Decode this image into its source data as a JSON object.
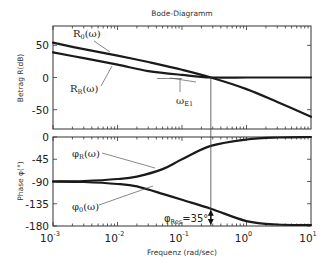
{
  "chart_data": [
    {
      "type": "line",
      "panel": "magnitude",
      "title": "Bode-Diagramm",
      "xlabel": "",
      "ylabel": "Betrag R(dB)",
      "xscale": "log",
      "xlim": [
        0.001,
        10
      ],
      "ylim": [
        -80,
        80
      ],
      "yticks": [
        50,
        0,
        -50
      ],
      "ytick_labels": [
        "50",
        "0",
        "-50"
      ],
      "grid": false,
      "series": [
        {
          "name": "R0(ω)",
          "label_text": "R",
          "label_sub": "0",
          "label_suffix": "(ω)",
          "x": [
            0.001,
            0.003,
            0.01,
            0.03,
            0.1,
            0.28,
            1,
            3,
            10
          ],
          "y": [
            54,
            44,
            34,
            24,
            12,
            0,
            -18,
            -38,
            -61
          ]
        },
        {
          "name": "RR(ω)",
          "label_text": "R",
          "label_sub": "R",
          "label_suffix": "(ω)",
          "x": [
            0.001,
            0.003,
            0.01,
            0.03,
            0.1,
            0.28,
            1,
            3,
            10
          ],
          "y": [
            39,
            30,
            20,
            10,
            4,
            0,
            0,
            0,
            0
          ]
        }
      ],
      "annotations": [
        {
          "text": "ω",
          "sub": "E1",
          "note": "gain crossover frequency",
          "x": 0.28,
          "y": 0
        }
      ]
    },
    {
      "type": "line",
      "panel": "phase",
      "title": "",
      "xlabel": "Frequenz  (rad/sec)",
      "ylabel": "Phase φ(°)",
      "xscale": "log",
      "xlim": [
        0.001,
        10
      ],
      "xticks": [
        0.001,
        0.01,
        0.1,
        1,
        10
      ],
      "xtick_labels": [
        "10^-3",
        "10^-2",
        "10^-1",
        "10^0",
        "10^1"
      ],
      "ylim": [
        -180,
        0
      ],
      "yticks": [
        0,
        -45,
        -90,
        -135,
        -180
      ],
      "ytick_labels": [
        "0",
        "-45",
        "-90",
        "-135",
        "-180"
      ],
      "grid": false,
      "series": [
        {
          "name": "φR(ω)",
          "label_text": "φ",
          "label_sub": "R",
          "label_suffix": "(ω)",
          "x": [
            0.001,
            0.003,
            0.01,
            0.02,
            0.05,
            0.1,
            0.28,
            1,
            3,
            10
          ],
          "y": [
            -90,
            -89,
            -85,
            -80,
            -65,
            -45,
            -18,
            -5,
            -1,
            0
          ]
        },
        {
          "name": "φ0(ω)",
          "label_text": "φ",
          "label_sub": "0",
          "label_suffix": "(ω)",
          "x": [
            0.001,
            0.003,
            0.01,
            0.02,
            0.05,
            0.1,
            0.28,
            1,
            3,
            10
          ],
          "y": [
            -90,
            -91,
            -95,
            -100,
            -115,
            -127,
            -145,
            -170,
            -177,
            -178
          ]
        }
      ],
      "annotations": [
        {
          "text": "φ",
          "sub": "Res",
          "suffix": "=35°",
          "note": "phase margin",
          "x": 0.28,
          "y_from": -145,
          "y_to": -180
        }
      ]
    }
  ],
  "figure": {
    "title": "Bode-Diagramm",
    "mag_ylabel": "Betrag R(dB)",
    "phase_ylabel": "Phase φ(°)",
    "xlabel": "Frequenz  (rad/sec)",
    "crossover_x": 0.28,
    "line_color": "#1a1a1a",
    "frame_color": "#333333"
  }
}
